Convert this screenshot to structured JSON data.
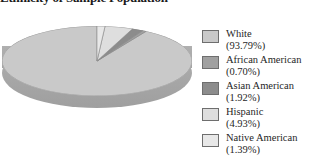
{
  "chart_data": {
    "type": "pie",
    "title": "Ethnicity of Sample Population",
    "title_visible_fragment": "nicity",
    "categories": [
      "White",
      "African American",
      "Asian American",
      "Hispanic",
      "Native American"
    ],
    "values": [
      93.79,
      0.7,
      1.92,
      4.93,
      1.39
    ],
    "value_labels": [
      "(93.79%)",
      "(0.70%)",
      "(1.92%)",
      "(4.93%)",
      "(1.39%)"
    ],
    "unit": "%",
    "colors": [
      "#c9c9c9",
      "#a0a0a0",
      "#8c8c8c",
      "#dedede",
      "#e8e8e8"
    ],
    "legend_position": "right",
    "three_d": true,
    "start_angle_deg": -90,
    "direction": "counterclockwise",
    "grid": false,
    "xlabel": "",
    "ylabel": ""
  },
  "legend": {
    "items": [
      {
        "label": "White",
        "value": "(93.79%)",
        "color": "#c9c9c9"
      },
      {
        "label": "African American",
        "value": "(0.70%)",
        "color": "#a0a0a0"
      },
      {
        "label": "Asian American",
        "value": "(1.92%)",
        "color": "#8c8c8c"
      },
      {
        "label": "Hispanic",
        "value": "(4.93%)",
        "color": "#dedede"
      },
      {
        "label": "Native American",
        "value": "(1.39%)",
        "color": "#e8e8e8"
      }
    ]
  }
}
